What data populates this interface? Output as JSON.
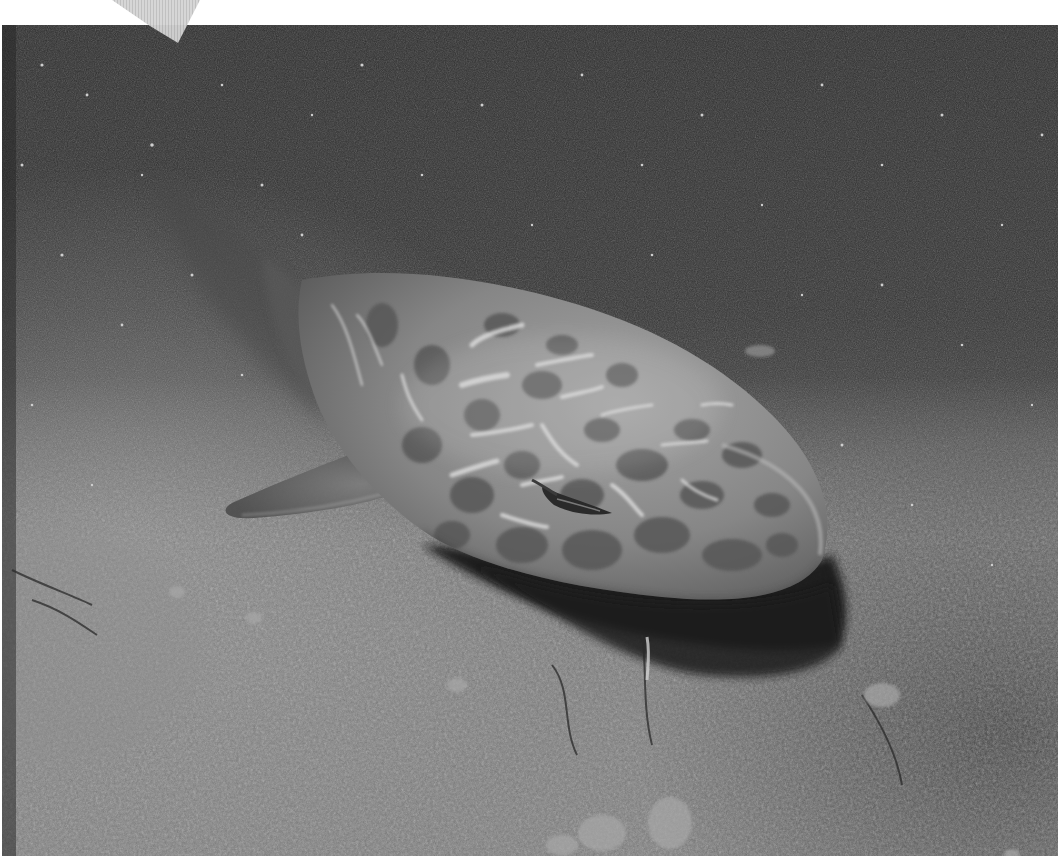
{
  "image": {
    "description": "Grayscale underwater photograph of a spotted shark resting on a sandy seabed with suspended particles in dark water",
    "subject": "shark",
    "setting": "sandy sea floor, underwater",
    "color_mode": "grayscale",
    "palette": {
      "water_dark": "#2a2a2a",
      "water_mid": "#3c3c3c",
      "sand": "#6e6e6e",
      "sand_light": "#8a8a8a",
      "shark_body": "#8c8c8c",
      "shark_spots": "#5a5a5a",
      "highlight": "#d8d8d8",
      "shadow": "#161616",
      "margin": "#ffffff",
      "corner_mark": "#c8c8c8"
    }
  },
  "frame": {
    "margin_top_px": 25,
    "margin_bottom_px": 12,
    "margin_right_px": 4,
    "corner_mark": "grey triangle at top-left edge"
  }
}
